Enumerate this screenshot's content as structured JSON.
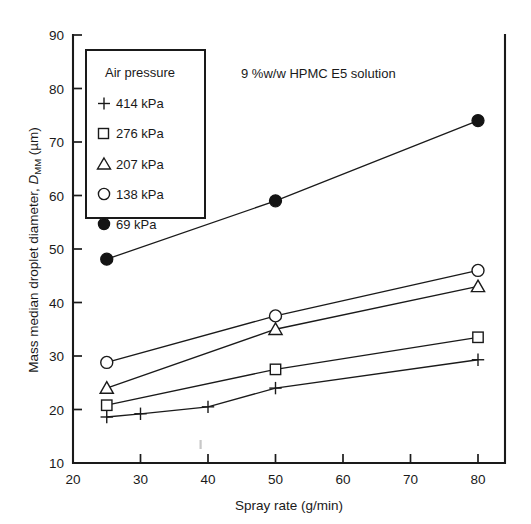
{
  "chart_data": {
    "type": "line",
    "title": "9 %w/w HPMC E5 solution",
    "xlabel": "Spray rate (g/min)",
    "ylabel": "Mass median droplet diameter, D_MM (µm)",
    "ylabel_parts": {
      "lead": "Mass median droplet diameter, ",
      "symbol": "D",
      "subscript": "MM",
      "units": " (µm)"
    },
    "xlim": [
      20,
      84
    ],
    "ylim": [
      10,
      90
    ],
    "xticks": [
      20,
      30,
      40,
      50,
      60,
      70,
      80
    ],
    "yticks": [
      10,
      20,
      30,
      40,
      50,
      60,
      70,
      80,
      90
    ],
    "xticklabels": [
      "20",
      "30",
      "40",
      "50",
      "60",
      "70",
      "80"
    ],
    "yticklabels": [
      "10",
      "20",
      "30",
      "40",
      "50",
      "60",
      "70",
      "80",
      "90"
    ],
    "grid": false,
    "legend_position": "upper-left-inside",
    "legend_title": "Air pressure",
    "series": [
      {
        "name": "414 kPa",
        "marker": "plus",
        "filled": false,
        "x": [
          25,
          30,
          40,
          50,
          80
        ],
        "y": [
          18.6,
          19.2,
          20.5,
          24.0,
          29.3
        ]
      },
      {
        "name": "276 kPa",
        "marker": "square",
        "filled": false,
        "x": [
          25,
          50,
          80
        ],
        "y": [
          20.8,
          27.5,
          33.5
        ]
      },
      {
        "name": "207 kPa",
        "marker": "triangle",
        "filled": false,
        "x": [
          25,
          50,
          80
        ],
        "y": [
          24.0,
          35.0,
          43.0
        ]
      },
      {
        "name": "138 kPa",
        "marker": "circle",
        "filled": false,
        "x": [
          25,
          50,
          80
        ],
        "y": [
          28.8,
          37.5,
          46.0
        ]
      },
      {
        "name": "69 kPa",
        "marker": "circle",
        "filled": true,
        "x": [
          25,
          50,
          80
        ],
        "y": [
          48.1,
          59.0,
          74.0
        ]
      }
    ]
  },
  "legend": {
    "title": "Air pressure",
    "entries": [
      {
        "marker": "plus",
        "label": "414 kPa"
      },
      {
        "marker": "square",
        "label": "276 kPa"
      },
      {
        "marker": "triangle",
        "label": "207 kPa"
      },
      {
        "marker": "circle-open",
        "label": "138 kPa"
      },
      {
        "marker": "circle-filled",
        "label": "69 kPa"
      }
    ]
  },
  "colors": {
    "ink": "#1a1a1a",
    "background": "#ffffff"
  }
}
